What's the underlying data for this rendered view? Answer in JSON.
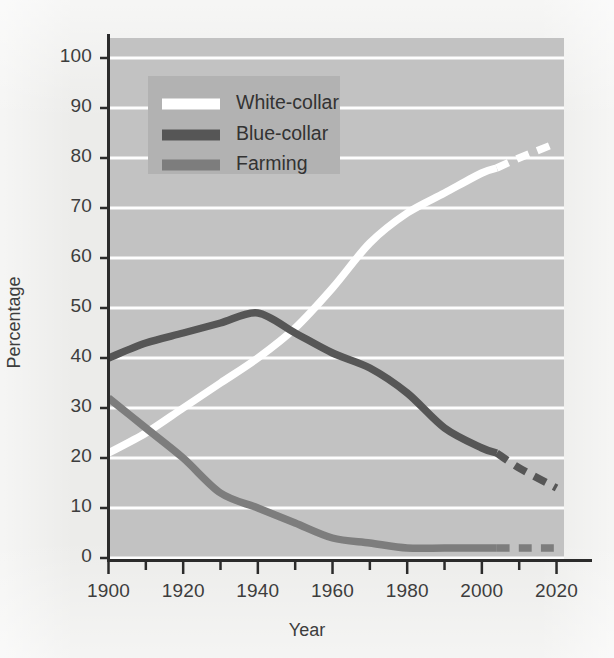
{
  "chart_data": {
    "type": "line",
    "title": "",
    "xlabel": "Year",
    "ylabel": "Percentage",
    "xlim": [
      1900,
      2022
    ],
    "ylim": [
      0,
      104
    ],
    "grid": true,
    "grid_axis": "y",
    "grid_color": "#ffffff",
    "plot_background": "#c2c2c2",
    "page_background": "#ececea",
    "legend_position": "upper-left-inside",
    "legend_background": "#b4b4b4",
    "xticks": [
      1900,
      1920,
      1940,
      1960,
      1980,
      2000,
      2020
    ],
    "xtick_labels": [
      "1900",
      "1920",
      "1940",
      "1960",
      "1980",
      "2000",
      "2020"
    ],
    "xminor_ticks": [
      1910,
      1930,
      1950,
      1970,
      1990,
      2010
    ],
    "yticks": [
      0,
      10,
      20,
      30,
      40,
      50,
      60,
      70,
      80,
      90,
      100
    ],
    "ytick_labels": [
      "0",
      "10",
      "20",
      "30",
      "40",
      "50",
      "60",
      "70",
      "80",
      "90",
      "100"
    ],
    "projection_start_year": 2004,
    "projection_note": "segments after 2004 drawn dashed (projected)",
    "series": [
      {
        "name": "White-collar",
        "color": "#ffffff",
        "x": [
          1900,
          1910,
          1920,
          1930,
          1940,
          1950,
          1960,
          1970,
          1980,
          1990,
          2000,
          2004,
          2010,
          2020
        ],
        "values": [
          21,
          25,
          30,
          35,
          40,
          46,
          54,
          63,
          69,
          73,
          77,
          78,
          80,
          83
        ]
      },
      {
        "name": "Blue-collar",
        "color": "#565656",
        "x": [
          1900,
          1910,
          1920,
          1930,
          1940,
          1950,
          1960,
          1970,
          1980,
          1990,
          2000,
          2004,
          2010,
          2020
        ],
        "values": [
          40,
          43,
          45,
          47,
          49,
          45,
          41,
          38,
          33,
          26,
          22,
          21,
          18,
          14
        ]
      },
      {
        "name": "Farming",
        "color": "#7d7d7d",
        "x": [
          1900,
          1910,
          1920,
          1930,
          1940,
          1950,
          1960,
          1970,
          1980,
          1990,
          2000,
          2004,
          2010,
          2020
        ],
        "values": [
          32,
          26,
          20,
          13,
          10,
          7,
          4,
          3,
          2,
          2,
          2,
          2,
          2,
          2
        ]
      }
    ],
    "legend_entries": [
      {
        "label": "White-collar",
        "color": "#ffffff"
      },
      {
        "label": "Blue-collar",
        "color": "#565656"
      },
      {
        "label": "Farming",
        "color": "#7d7d7d"
      }
    ]
  }
}
